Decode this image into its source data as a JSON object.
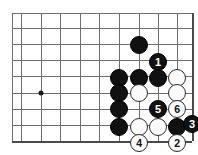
{
  "figure": {
    "kind": "go-board-diagram",
    "width": 198,
    "height": 155,
    "background_color": "#ffffff",
    "line_color": "#6e6e6e",
    "edge_line_color": "#4a4a4a",
    "black_color": "#111111",
    "white_color": "#fbfbfb",
    "black_label_color": "#ffffff",
    "white_label_color": "#111111"
  },
  "board": {
    "origin_x": 12,
    "origin_y": 13,
    "cell_width": 19.6,
    "cell_height": 16,
    "columns": 10,
    "rows": 9,
    "right_edge_x": 192,
    "bottom_edge_y": 141,
    "star_points": [
      {
        "name": "star-point-left",
        "x": 41,
        "y": 93
      }
    ]
  },
  "stones": [
    {
      "id": "black-stone-a",
      "color": "black",
      "x": 139,
      "y": 45,
      "label": "",
      "radius": 9
    },
    {
      "id": "move-1-black",
      "color": "black",
      "x": 158,
      "y": 62,
      "label": "1",
      "radius": 9
    },
    {
      "id": "white-stone-b",
      "color": "white",
      "x": 177,
      "y": 78,
      "label": "",
      "radius": 9
    },
    {
      "id": "black-stone-c",
      "color": "black",
      "x": 119,
      "y": 78,
      "label": "",
      "radius": 9
    },
    {
      "id": "black-stone-d",
      "color": "black",
      "x": 139,
      "y": 78,
      "label": "",
      "radius": 9
    },
    {
      "id": "black-stone-e",
      "color": "black",
      "x": 158,
      "y": 78,
      "label": "",
      "radius": 9
    },
    {
      "id": "black-stone-f",
      "color": "black",
      "x": 119,
      "y": 93,
      "label": "",
      "radius": 9
    },
    {
      "id": "white-stone-g",
      "color": "white",
      "x": 139,
      "y": 93,
      "label": "",
      "radius": 9
    },
    {
      "id": "white-stone-h",
      "color": "white",
      "x": 177,
      "y": 93,
      "label": "",
      "radius": 9
    },
    {
      "id": "black-stone-i",
      "color": "black",
      "x": 119,
      "y": 109,
      "label": "",
      "radius": 9
    },
    {
      "id": "move-5-black",
      "color": "black",
      "x": 158,
      "y": 109,
      "label": "5",
      "radius": 9
    },
    {
      "id": "move-6-white",
      "color": "white",
      "x": 177,
      "y": 109,
      "label": "6",
      "radius": 9
    },
    {
      "id": "black-stone-j",
      "color": "black",
      "x": 119,
      "y": 127,
      "label": "",
      "radius": 9
    },
    {
      "id": "white-stone-k",
      "color": "white",
      "x": 139,
      "y": 127,
      "label": "",
      "radius": 9
    },
    {
      "id": "white-stone-l",
      "color": "white",
      "x": 158,
      "y": 127,
      "label": "",
      "radius": 9
    },
    {
      "id": "black-stone-m",
      "color": "black",
      "x": 177,
      "y": 127,
      "label": "",
      "radius": 9
    },
    {
      "id": "move-3-black",
      "color": "black",
      "x": 192,
      "y": 124,
      "label": "3",
      "radius": 9
    },
    {
      "id": "move-4-white",
      "color": "white",
      "x": 139,
      "y": 143,
      "label": "4",
      "radius": 9
    },
    {
      "id": "move-2-white",
      "color": "white",
      "x": 177,
      "y": 143,
      "label": "2",
      "radius": 9
    }
  ],
  "grid": {
    "horizontal_y": [
      13,
      28,
      44,
      60,
      76,
      93,
      109,
      125,
      141
    ],
    "vertical_x": [
      12,
      21,
      41,
      60,
      80,
      99,
      119,
      139,
      158,
      177,
      192
    ],
    "horizontal_x_start": 12,
    "horizontal_x_end": 192,
    "vertical_y_start": 13,
    "vertical_y_end": 141
  }
}
